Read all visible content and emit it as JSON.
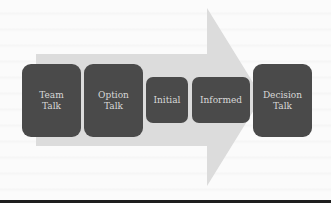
{
  "diagram": {
    "type": "process-arrow",
    "arrow_color": "#dcdcdc",
    "box_color": "#4a4a4a",
    "text_color": "#d8d8d8",
    "steps": [
      {
        "label": "Team Talk"
      },
      {
        "label": "Option Talk"
      },
      {
        "label": "Initial"
      },
      {
        "label": "Informed"
      },
      {
        "label": "Decision Talk"
      }
    ]
  }
}
